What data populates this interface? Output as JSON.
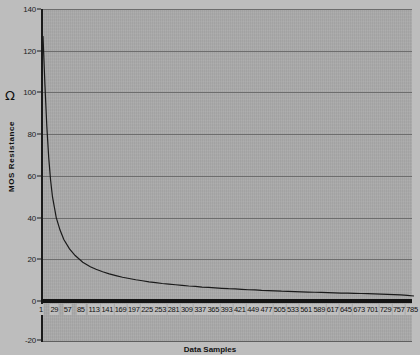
{
  "chart_data": {
    "type": "line",
    "title": "",
    "xlabel": "Data Samples",
    "ylabel": "MOS Resistance",
    "yunit": "Ω",
    "ylim": [
      -20,
      140
    ],
    "xlim": [
      1,
      785
    ],
    "grid": true,
    "legend": "none",
    "y_ticks": [
      140,
      120,
      100,
      80,
      60,
      40,
      20,
      0,
      -20
    ],
    "x_ticks": [
      1,
      29,
      57,
      85,
      113,
      141,
      169,
      197,
      225,
      253,
      281,
      309,
      337,
      365,
      393,
      421,
      449,
      477,
      505,
      533,
      561,
      589,
      617,
      645,
      673,
      701,
      729,
      757,
      785
    ],
    "series": [
      {
        "name": "MOS Resistance",
        "color": "#1a1a1a",
        "x": [
          1,
          5,
          9,
          13,
          17,
          21,
          29,
          37,
          45,
          57,
          69,
          85,
          101,
          113,
          127,
          141,
          155,
          169,
          183,
          197,
          211,
          225,
          239,
          253,
          267,
          281,
          295,
          309,
          323,
          337,
          351,
          365,
          379,
          393,
          407,
          421,
          435,
          449,
          463,
          477,
          491,
          505,
          519,
          533,
          547,
          561,
          575,
          589,
          603,
          617,
          631,
          645,
          659,
          673,
          687,
          701,
          715,
          729,
          743,
          757,
          771,
          785
        ],
        "y": [
          127.0,
          104.0,
          84.0,
          69.0,
          58.0,
          50.0,
          40.0,
          34.0,
          29.5,
          25.0,
          21.8,
          18.6,
          16.4,
          15.2,
          14.0,
          13.0,
          12.2,
          11.4,
          10.8,
          10.2,
          9.7,
          9.2,
          8.8,
          8.4,
          8.1,
          7.8,
          7.5,
          7.2,
          7.0,
          6.7,
          6.5,
          6.3,
          6.1,
          5.9,
          5.8,
          5.6,
          5.4,
          5.3,
          5.1,
          5.0,
          4.9,
          4.7,
          4.6,
          4.5,
          4.4,
          4.3,
          4.2,
          4.1,
          4.0,
          3.9,
          3.8,
          3.8,
          3.7,
          3.6,
          3.5,
          3.4,
          3.3,
          3.2,
          3.1,
          2.9,
          2.7,
          2.4
        ]
      }
    ],
    "colors": {
      "plot_background": "#a9a9a9",
      "figure_background": "#bdbdbd",
      "gridline": "#6d6d6d",
      "axis": "#141414",
      "series": "#1a1a1a"
    }
  }
}
